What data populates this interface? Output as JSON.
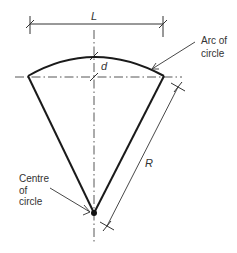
{
  "diagram": {
    "labels": {
      "length": "L",
      "rise": "d",
      "radius": "R",
      "arc_line1": "Arc of",
      "arc_line2": "circle",
      "centre_line1": "Centre",
      "centre_line2": "of",
      "centre_line3": "circle"
    },
    "colors": {
      "stroke": "#1a1a1a",
      "thin_stroke": "#333333",
      "text": "#333333",
      "background": "#ffffff"
    }
  }
}
